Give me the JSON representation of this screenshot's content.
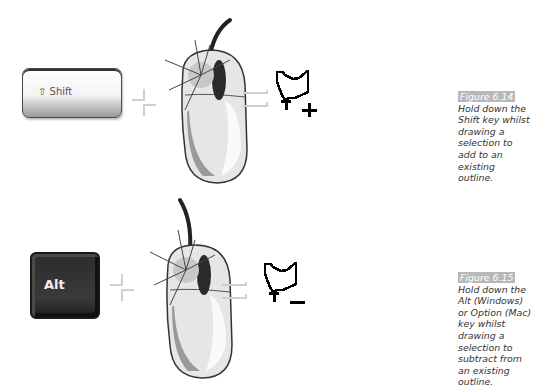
{
  "figures": [
    {
      "id": "figure-6-14",
      "key_label": "Shift",
      "key_icon": "shift-arrow-icon",
      "operator_plus": "+",
      "operator_equals": "=",
      "result_modifier": "+",
      "figure_number": "Figure 6.14",
      "caption": "Hold down the Shift key whilst drawing a selection to add to an existing outline."
    },
    {
      "id": "figure-6-15",
      "key_label": "Alt",
      "operator_plus": "+",
      "operator_equals": "=",
      "result_modifier": "−",
      "figure_number": "Figure 6.15",
      "caption": "Hold down the Alt (Windows) or Option (Mac) key whilst drawing a selection to subtract from an existing outline."
    }
  ],
  "colors": {
    "figure_label_bg": "#b8b8b8",
    "caption_text": "#333333",
    "alt_key": "#2c2c2c",
    "shift_key": "#f4f4f4"
  }
}
